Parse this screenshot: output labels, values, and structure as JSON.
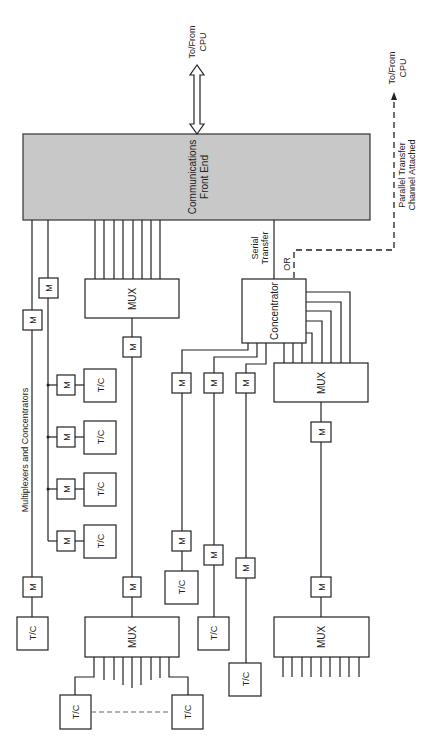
{
  "diagram": {
    "front_end": {
      "line1": "Communications",
      "line2": "Front End"
    },
    "cpu_top": {
      "line1": "To/From",
      "line2": "CPU"
    },
    "cpu_right": {
      "line1": "To/From",
      "line2": "CPU"
    },
    "parallel": {
      "line1": "Parallel Transfer",
      "line2": "Channel Attached"
    },
    "serial": {
      "line1": "Serial",
      "line2": "Transfer"
    },
    "or_label": "OR",
    "concentrator": "Concentrator",
    "mux": "MUX",
    "modem": "M",
    "terminal": "T/C",
    "section_label": "Multiplexers and Concentrators"
  }
}
